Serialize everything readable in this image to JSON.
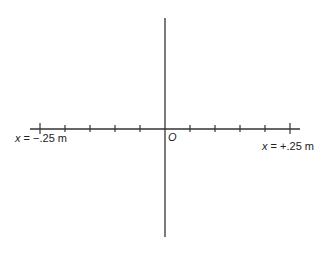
{
  "diagram": {
    "type": "coordinate-axes",
    "x_axis": {
      "left_label_var": "x",
      "left_label_value": " = −.25 m",
      "right_label_var": "x",
      "right_label_value": " = +.25 m",
      "tick_count": 11,
      "range_m": [
        -0.25,
        0.25
      ]
    },
    "origin_label": "O",
    "colors": {
      "line": "#333333",
      "background": "#ffffff"
    }
  }
}
